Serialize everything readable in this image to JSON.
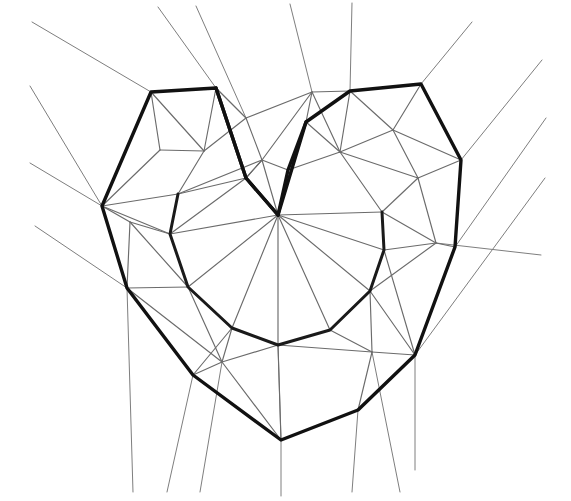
{
  "figure": {
    "kind": "line-drawing",
    "background_color": "#ffffff",
    "stroke_colors": {
      "bold_feature_curve": "#111111",
      "mesh_edge": "#6b6b6b",
      "faint_mesh_edge": "#7e7e7e"
    },
    "canvas": {
      "width": 571,
      "height": 501
    },
    "stroke_widths": {
      "bold_feature_curve": 3.4,
      "inner_feature_curve": 3.0,
      "mesh_edge": 1.15,
      "faint_mesh_edge": 1.0
    }
  },
  "geometry": {
    "outer_heart_boundary": {
      "label": "outer-heart-boundary",
      "closed": true,
      "points": [
        [
          216,
          88
        ],
        [
          151,
          92
        ],
        [
          102,
          206
        ],
        [
          127,
          288
        ],
        [
          193,
          375
        ],
        [
          281,
          440
        ],
        [
          358,
          410
        ],
        [
          415,
          355
        ],
        [
          455,
          247
        ],
        [
          461,
          160
        ],
        [
          421,
          84
        ],
        [
          350,
          91
        ],
        [
          306,
          122
        ],
        [
          278,
          215
        ],
        [
          246,
          178
        ]
      ]
    },
    "inner_heart_curve": {
      "label": "inner-heart-curve",
      "closed": false,
      "points": [
        [
          178,
          194
        ],
        [
          170,
          234
        ],
        [
          188,
          287
        ],
        [
          232,
          328
        ],
        [
          278,
          345
        ],
        [
          330,
          330
        ],
        [
          370,
          291
        ],
        [
          384,
          250
        ],
        [
          382,
          212
        ]
      ]
    },
    "notch_left_limb": {
      "label": "notch-left-limb",
      "points": [
        [
          216,
          88
        ],
        [
          246,
          178
        ],
        [
          278,
          215
        ]
      ]
    },
    "notch_right_limb": {
      "label": "notch-right-limb",
      "points": [
        [
          306,
          122
        ],
        [
          288,
          170
        ],
        [
          278,
          215
        ]
      ]
    },
    "interior_vertices": [
      [
        178,
        194
      ],
      [
        170,
        234
      ],
      [
        188,
        287
      ],
      [
        232,
        328
      ],
      [
        278,
        345
      ],
      [
        330,
        330
      ],
      [
        370,
        291
      ],
      [
        384,
        250
      ],
      [
        382,
        212
      ],
      [
        278,
        215
      ],
      [
        246,
        178
      ],
      [
        288,
        170
      ],
      [
        262,
        160
      ],
      [
        340,
        152
      ],
      [
        246,
        118
      ],
      [
        204,
        151
      ],
      [
        130,
        222
      ],
      [
        160,
        150
      ],
      [
        418,
        178
      ],
      [
        436,
        243
      ],
      [
        393,
        130
      ],
      [
        312,
        92
      ],
      [
        372,
        352
      ],
      [
        222,
        362
      ]
    ],
    "mesh_edges": [
      [
        [
          151,
          92
        ],
        [
          204,
          151
        ]
      ],
      [
        [
          204,
          151
        ],
        [
          216,
          88
        ]
      ],
      [
        [
          204,
          151
        ],
        [
          246,
          118
        ]
      ],
      [
        [
          246,
          118
        ],
        [
          216,
          88
        ]
      ],
      [
        [
          246,
          118
        ],
        [
          262,
          160
        ]
      ],
      [
        [
          262,
          160
        ],
        [
          246,
          178
        ]
      ],
      [
        [
          204,
          151
        ],
        [
          178,
          194
        ]
      ],
      [
        [
          178,
          194
        ],
        [
          170,
          234
        ]
      ],
      [
        [
          102,
          206
        ],
        [
          178,
          194
        ]
      ],
      [
        [
          102,
          206
        ],
        [
          170,
          234
        ]
      ],
      [
        [
          102,
          206
        ],
        [
          160,
          150
        ]
      ],
      [
        [
          160,
          150
        ],
        [
          151,
          92
        ]
      ],
      [
        [
          160,
          150
        ],
        [
          204,
          151
        ]
      ],
      [
        [
          102,
          206
        ],
        [
          130,
          222
        ]
      ],
      [
        [
          130,
          222
        ],
        [
          170,
          234
        ]
      ],
      [
        [
          130,
          222
        ],
        [
          127,
          288
        ]
      ],
      [
        [
          127,
          288
        ],
        [
          188,
          287
        ]
      ],
      [
        [
          130,
          222
        ],
        [
          188,
          287
        ]
      ],
      [
        [
          127,
          288
        ],
        [
          222,
          362
        ]
      ],
      [
        [
          188,
          287
        ],
        [
          222,
          362
        ]
      ],
      [
        [
          222,
          362
        ],
        [
          232,
          328
        ]
      ],
      [
        [
          188,
          287
        ],
        [
          232,
          328
        ]
      ],
      [
        [
          222,
          362
        ],
        [
          193,
          375
        ]
      ],
      [
        [
          222,
          362
        ],
        [
          278,
          345
        ]
      ],
      [
        [
          232,
          328
        ],
        [
          278,
          345
        ]
      ],
      [
        [
          278,
          345
        ],
        [
          281,
          440
        ]
      ],
      [
        [
          222,
          362
        ],
        [
          281,
          440
        ]
      ],
      [
        [
          278,
          345
        ],
        [
          330,
          330
        ]
      ],
      [
        [
          330,
          330
        ],
        [
          372,
          352
        ]
      ],
      [
        [
          278,
          345
        ],
        [
          372,
          352
        ]
      ],
      [
        [
          372,
          352
        ],
        [
          415,
          355
        ]
      ],
      [
        [
          372,
          352
        ],
        [
          358,
          410
        ]
      ],
      [
        [
          281,
          440
        ],
        [
          358,
          410
        ]
      ],
      [
        [
          330,
          330
        ],
        [
          370,
          291
        ]
      ],
      [
        [
          370,
          291
        ],
        [
          384,
          250
        ]
      ],
      [
        [
          384,
          250
        ],
        [
          382,
          212
        ]
      ],
      [
        [
          382,
          212
        ],
        [
          340,
          152
        ]
      ],
      [
        [
          340,
          152
        ],
        [
          306,
          122
        ]
      ],
      [
        [
          340,
          152
        ],
        [
          288,
          170
        ]
      ],
      [
        [
          288,
          170
        ],
        [
          262,
          160
        ]
      ],
      [
        [
          262,
          160
        ],
        [
          278,
          215
        ]
      ],
      [
        [
          288,
          170
        ],
        [
          278,
          215
        ]
      ],
      [
        [
          278,
          215
        ],
        [
          170,
          234
        ]
      ],
      [
        [
          278,
          215
        ],
        [
          188,
          287
        ]
      ],
      [
        [
          278,
          215
        ],
        [
          232,
          328
        ]
      ],
      [
        [
          278,
          215
        ],
        [
          278,
          345
        ]
      ],
      [
        [
          278,
          215
        ],
        [
          330,
          330
        ]
      ],
      [
        [
          278,
          215
        ],
        [
          370,
          291
        ]
      ],
      [
        [
          278,
          215
        ],
        [
          384,
          250
        ]
      ],
      [
        [
          278,
          215
        ],
        [
          382,
          212
        ]
      ],
      [
        [
          178,
          194
        ],
        [
          246,
          178
        ]
      ],
      [
        [
          178,
          194
        ],
        [
          262,
          160
        ]
      ],
      [
        [
          170,
          234
        ],
        [
          246,
          178
        ]
      ],
      [
        [
          246,
          178
        ],
        [
          262,
          160
        ]
      ],
      [
        [
          312,
          92
        ],
        [
          306,
          122
        ]
      ],
      [
        [
          312,
          92
        ],
        [
          350,
          91
        ]
      ],
      [
        [
          312,
          92
        ],
        [
          340,
          152
        ]
      ],
      [
        [
          312,
          92
        ],
        [
          246,
          118
        ]
      ],
      [
        [
          312,
          92
        ],
        [
          262,
          160
        ]
      ],
      [
        [
          350,
          91
        ],
        [
          340,
          152
        ]
      ],
      [
        [
          350,
          91
        ],
        [
          393,
          130
        ]
      ],
      [
        [
          393,
          130
        ],
        [
          421,
          84
        ]
      ],
      [
        [
          393,
          130
        ],
        [
          340,
          152
        ]
      ],
      [
        [
          393,
          130
        ],
        [
          418,
          178
        ]
      ],
      [
        [
          418,
          178
        ],
        [
          461,
          160
        ]
      ],
      [
        [
          418,
          178
        ],
        [
          382,
          212
        ]
      ],
      [
        [
          418,
          178
        ],
        [
          340,
          152
        ]
      ],
      [
        [
          418,
          178
        ],
        [
          436,
          243
        ]
      ],
      [
        [
          436,
          243
        ],
        [
          455,
          247
        ]
      ],
      [
        [
          436,
          243
        ],
        [
          384,
          250
        ]
      ],
      [
        [
          436,
          243
        ],
        [
          382,
          212
        ]
      ],
      [
        [
          436,
          243
        ],
        [
          370,
          291
        ]
      ],
      [
        [
          455,
          247
        ],
        [
          415,
          355
        ]
      ],
      [
        [
          461,
          160
        ],
        [
          455,
          247
        ]
      ],
      [
        [
          461,
          160
        ],
        [
          393,
          130
        ]
      ],
      [
        [
          421,
          84
        ],
        [
          461,
          160
        ]
      ],
      [
        [
          415,
          355
        ],
        [
          370,
          291
        ]
      ],
      [
        [
          415,
          355
        ],
        [
          384,
          250
        ]
      ],
      [
        [
          193,
          375
        ],
        [
          232,
          328
        ]
      ],
      [
        [
          193,
          375
        ],
        [
          127,
          288
        ]
      ],
      [
        [
          370,
          291
        ],
        [
          372,
          352
        ]
      ],
      [
        [
          384,
          250
        ],
        [
          370,
          291
        ]
      ]
    ],
    "extrusion_rays": {
      "label": "boundary-extrusion-rays",
      "description": "thin rays projecting outward from outer boundary vertices",
      "segments": [
        [
          [
            151,
            92
          ],
          [
            32,
            22
          ]
        ],
        [
          [
            102,
            206
          ],
          [
            30,
            86
          ]
        ],
        [
          [
            102,
            206
          ],
          [
            30,
            163
          ]
        ],
        [
          [
            127,
            288
          ],
          [
            35,
            226
          ]
        ],
        [
          [
            216,
            88
          ],
          [
            158,
            7
          ]
        ],
        [
          [
            246,
            118
          ],
          [
            196,
            6
          ]
        ],
        [
          [
            312,
            92
          ],
          [
            290,
            4
          ]
        ],
        [
          [
            350,
            91
          ],
          [
            352,
            3
          ]
        ],
        [
          [
            421,
            84
          ],
          [
            472,
            22
          ]
        ],
        [
          [
            461,
            160
          ],
          [
            542,
            60
          ]
        ],
        [
          [
            455,
            247
          ],
          [
            546,
            118
          ]
        ],
        [
          [
            415,
            355
          ],
          [
            545,
            178
          ]
        ],
        [
          [
            436,
            243
          ],
          [
            541,
            255
          ]
        ],
        [
          [
            127,
            288
          ],
          [
            133,
            492
          ]
        ],
        [
          [
            193,
            375
          ],
          [
            167,
            492
          ]
        ],
        [
          [
            222,
            362
          ],
          [
            200,
            492
          ]
        ],
        [
          [
            281,
            440
          ],
          [
            281,
            496
          ]
        ],
        [
          [
            278,
            345
          ],
          [
            281,
            440
          ]
        ],
        [
          [
            358,
            410
          ],
          [
            352,
            492
          ]
        ],
        [
          [
            372,
            352
          ],
          [
            400,
            492
          ]
        ],
        [
          [
            415,
            355
          ],
          [
            415,
            470
          ]
        ]
      ]
    }
  }
}
